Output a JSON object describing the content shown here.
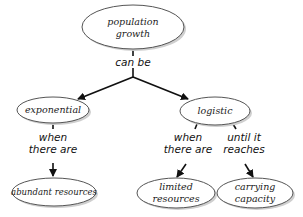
{
  "diagram": {
    "type": "concept-map",
    "nodes": [
      {
        "id": "population_growth",
        "lines": [
          "population",
          "growth"
        ]
      },
      {
        "id": "exponential",
        "lines": [
          "exponential"
        ]
      },
      {
        "id": "logistic",
        "lines": [
          "logistic"
        ]
      },
      {
        "id": "abundant_resources",
        "lines": [
          "abundant resources"
        ]
      },
      {
        "id": "limited_resources",
        "lines": [
          "limited",
          "resources"
        ]
      },
      {
        "id": "carrying_capacity",
        "lines": [
          "carrying",
          "capacity"
        ]
      }
    ],
    "links": [
      {
        "from": "population_growth",
        "to": "exponential",
        "label_lines": [
          "can be"
        ]
      },
      {
        "from": "population_growth",
        "to": "logistic",
        "label_lines": [
          "can be"
        ]
      },
      {
        "from": "exponential",
        "to": "abundant_resources",
        "label_lines": [
          "when",
          "there are"
        ]
      },
      {
        "from": "logistic",
        "to": "limited_resources",
        "label_lines": [
          "when",
          "there are"
        ]
      },
      {
        "from": "logistic",
        "to": "carrying_capacity",
        "label_lines": [
          "until it",
          "reaches"
        ]
      }
    ]
  }
}
